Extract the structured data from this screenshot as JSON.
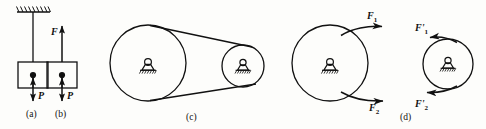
{
  "figure": {
    "type": "mechanics-free-body-diagram",
    "background_color": "#fdfdfb",
    "stroke_color": "#111111",
    "panels": [
      {
        "id": "a",
        "label": "(a)",
        "label_x": 33,
        "label_y": 113,
        "description": "block suspended from hatched ceiling by a rope",
        "elements": [
          {
            "name": "ceiling-hatch",
            "x": 16,
            "y": 6,
            "width": 34,
            "height": 6
          },
          {
            "name": "rope",
            "x1": 33,
            "y1": 12,
            "x2": 33,
            "y2": 62
          },
          {
            "name": "block",
            "x": 18,
            "y": 62,
            "width": 30,
            "height": 26
          },
          {
            "name": "center-dot",
            "cx": 33,
            "cy": 75,
            "r": 3
          },
          {
            "name": "weight-arrow",
            "x1": 33,
            "y1": 75,
            "x2": 33,
            "y2": 103,
            "direction": "down"
          },
          {
            "name": "weight-label",
            "text": "P",
            "x": 38,
            "y": 97
          }
        ]
      },
      {
        "id": "b",
        "label": "(b)",
        "label_x": 97,
        "label_y": 113,
        "description": "free body diagram of block with tension F up and weight P down",
        "elements": [
          {
            "name": "tension-arrow",
            "x1": 62,
            "y1": 62,
            "x2": 62,
            "y2": 24,
            "direction": "up"
          },
          {
            "name": "tension-label",
            "text": "F",
            "x": 51,
            "y": 32
          },
          {
            "name": "block",
            "x": 47,
            "y": 62,
            "width": 30,
            "height": 26
          },
          {
            "name": "center-dot",
            "cx": 62,
            "cy": 75,
            "r": 3
          },
          {
            "name": "weight-arrow",
            "x1": 62,
            "y1": 75,
            "x2": 62,
            "y2": 103,
            "direction": "down"
          },
          {
            "name": "weight-label",
            "text": "P",
            "x": 67,
            "y": 97
          }
        ]
      },
      {
        "id": "c",
        "label": "(c)",
        "label_x": 188,
        "label_y": 119,
        "description": "belt drive: large left pulley and small right pulley joined by a belt, both on pin supports",
        "elements": [
          {
            "name": "left-pulley",
            "cx": 148,
            "cy": 63,
            "r": 38
          },
          {
            "name": "left-pulley-support",
            "cx": 148,
            "cy": 69
          },
          {
            "name": "right-pulley",
            "cx": 243,
            "cy": 66,
            "r": 21
          },
          {
            "name": "right-pulley-support",
            "cx": 243,
            "cy": 70
          },
          {
            "name": "belt-upper",
            "x1": 152,
            "y1": 25,
            "x2": 256,
            "y2": 49
          },
          {
            "name": "belt-lower",
            "x1": 148,
            "y1": 101,
            "x2": 258,
            "y2": 85
          }
        ]
      },
      {
        "id": "d",
        "label": "(d)",
        "label_x": 403,
        "label_y": 119,
        "description": "belt tension pairs: large pulley with F1 and F2 pointing right, small pulley with F1-prime and F2-prime pointing left",
        "elements": [
          {
            "name": "large-circle",
            "cx": 330,
            "cy": 63,
            "r": 38
          },
          {
            "name": "large-circle-support",
            "cx": 330,
            "cy": 69
          },
          {
            "name": "force-1-arrow",
            "x1": 345,
            "y1": 30,
            "x2": 388,
            "y2": 26,
            "direction": "right"
          },
          {
            "name": "force-1-label",
            "text": "F",
            "sub": "1",
            "x": 368,
            "y": 14
          },
          {
            "name": "force-2-arrow",
            "x1": 345,
            "y1": 98,
            "x2": 390,
            "y2": 101,
            "direction": "right"
          },
          {
            "name": "force-2-label",
            "text": "F",
            "sub": "2",
            "x": 370,
            "y": 106
          },
          {
            "name": "small-circle",
            "cx": 448,
            "cy": 64,
            "r": 25
          },
          {
            "name": "small-circle-support",
            "cx": 448,
            "cy": 68
          },
          {
            "name": "force-1-prime-arrow",
            "x1": 452,
            "y1": 42,
            "x2": 424,
            "y2": 37,
            "direction": "left"
          },
          {
            "name": "force-1-prime-label",
            "text": "F",
            "sub": "1",
            "prime": "'",
            "x": 417,
            "y": 27
          },
          {
            "name": "force-2-prime-arrow",
            "x1": 452,
            "y1": 88,
            "x2": 420,
            "y2": 93,
            "direction": "left"
          },
          {
            "name": "force-2-prime-label",
            "text": "F",
            "sub": "2",
            "prime": "'",
            "x": 417,
            "y": 103
          }
        ]
      }
    ],
    "labels": {
      "panel_a": "(a)",
      "panel_b": "(b)",
      "panel_c": "(c)",
      "panel_d": "(d)",
      "force_P": "P",
      "force_F": "F",
      "force_F1": "F",
      "force_F1_sub": "1",
      "force_F2": "F",
      "force_F2_sub": "2",
      "force_F1_prime": "F",
      "force_F1_prime_sub": "1",
      "force_F2_prime": "F",
      "force_F2_prime_sub": "2",
      "prime_mark": "'"
    }
  }
}
